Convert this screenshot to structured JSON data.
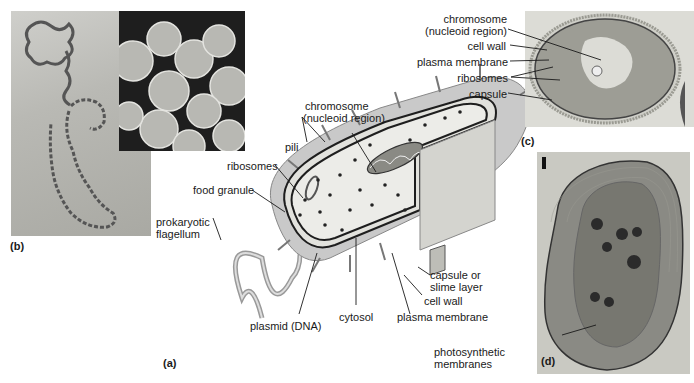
{
  "figure": {
    "panels": {
      "a": {
        "letter": "(a)",
        "caption": "prokaryotic cell diagram"
      },
      "b": {
        "letter": "(b)"
      },
      "c": {
        "letter": "(c)"
      },
      "d": {
        "letter": "(d)"
      }
    },
    "diagram_labels": {
      "chromosome": "chromosome",
      "nucleoid": "(nucleoid region)",
      "pili": "pili",
      "ribosomes": "ribosomes",
      "food_granule": "food granule",
      "flagellum_1": "prokaryotic",
      "flagellum_2": "flagellum",
      "plasmid": "plasmid (DNA)",
      "cytosol": "cytosol",
      "capsule_1": "capsule or",
      "capsule_2": "slime layer",
      "cell_wall": "cell wall",
      "plasma_membrane": "plasma membrane"
    },
    "micrograph_c_labels": {
      "chromosome": "chromosome",
      "nucleoid": "(nucleoid region)",
      "cell_wall": "cell wall",
      "plasma_membrane": "plasma membrane",
      "ribosomes": "ribosomes",
      "capsule": "capsule"
    },
    "micrograph_d_labels": {
      "photosynthetic_1": "photosynthetic",
      "photosynthetic_2": "membranes"
    },
    "colors": {
      "capsule": "#c9c9c9",
      "cytosol": "#ecece8",
      "membrane": "#1e1e1e",
      "micrograph_dark": "#2b2b2b",
      "micrograph_mid": "#8a8a84"
    }
  }
}
